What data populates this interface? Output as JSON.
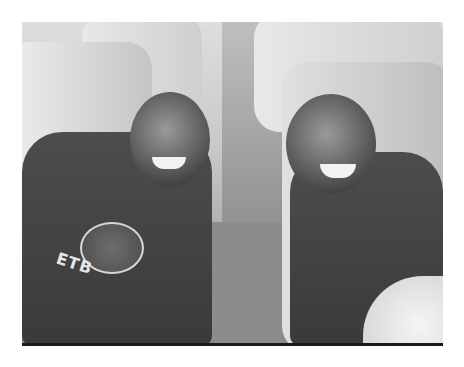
{
  "image": {
    "description": "Grayscale photo of two smiling boys seated on a bus, leaning toward the aisle",
    "colors": {
      "background": "#ffffff",
      "frame_rule": "#1a1a1a",
      "shirt": "#3f3f3f",
      "seat": "#d8d8d8"
    }
  },
  "left_person": {
    "shirt_text": "ETB"
  }
}
